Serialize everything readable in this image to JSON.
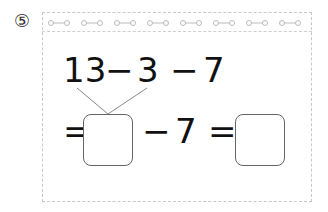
{
  "problem": {
    "number_label": "⑤",
    "decoration": {
      "chain_links": 9,
      "chain_icon": "chain-link-icon"
    },
    "top_expression": {
      "a": "13",
      "op1": "−",
      "b": "3",
      "op2": "−",
      "c": "7"
    },
    "bottom_expression": {
      "eq1": "=",
      "answer_box_1": "",
      "op": "−",
      "n": "7",
      "eq2": "=",
      "answer_box_2": ""
    },
    "colors": {
      "frame_border": "#c8c8c8",
      "box_border": "#666666",
      "text": "#111111"
    }
  }
}
